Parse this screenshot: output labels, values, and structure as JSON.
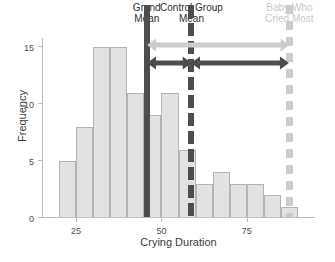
{
  "chart_data": {
    "type": "bar",
    "title": "",
    "subtitle": "",
    "xlabel": "Crying Duration",
    "ylabel": "Frequency",
    "xlim": [
      15,
      95
    ],
    "ylim": [
      0,
      15.8
    ],
    "xticks": [
      25,
      50,
      75
    ],
    "yticks": [
      0,
      5,
      10,
      15
    ],
    "grid": false,
    "legend_position": "none",
    "bin_width": 5,
    "bin_starts": [
      20,
      25,
      30,
      35,
      40,
      45,
      50,
      55,
      60,
      65,
      70,
      75,
      80,
      85
    ],
    "categories": [
      "20-25",
      "25-30",
      "30-35",
      "35-40",
      "40-45",
      "45-50",
      "50-55",
      "55-60",
      "60-65",
      "65-70",
      "70-75",
      "75-80",
      "80-85",
      "85-90"
    ],
    "values": [
      5,
      8,
      15,
      15,
      11,
      9,
      11,
      6,
      3,
      4,
      3,
      3,
      2,
      1
    ],
    "bar_color": "#e2e2e2",
    "bar_edge_color": "#b4b4b4",
    "annotations": [
      {
        "name": "grand-mean",
        "label": "Grand\nMean",
        "label_line1": "Grand",
        "label_line2": "Mean",
        "x": 45.7,
        "style": "solid",
        "color": "#4d4d4d"
      },
      {
        "name": "control-group-mean",
        "label": "Control Group\nMean",
        "label_line1": "Control Group",
        "label_line2": "Mean",
        "x": 58.8,
        "style": "dashed",
        "color": "#4d4d4d"
      },
      {
        "name": "baby-who-cried-most",
        "label": "Baby Who\nCried Most",
        "label_line1": "Baby Who",
        "label_line2": "Cried Most",
        "x": 87.5,
        "style": "dashed",
        "color": "#cccccc"
      }
    ],
    "span_arrows": [
      {
        "name": "total-deviation",
        "from": 45.7,
        "to": 87.5,
        "color": "#cccccc",
        "row": 1
      },
      {
        "name": "between-group-deviation",
        "from": 45.7,
        "to": 58.8,
        "color": "#4d4d4d",
        "row": 2
      },
      {
        "name": "within-group-deviation",
        "from": 58.8,
        "to": 87.5,
        "color": "#4d4d4d",
        "row": 2
      }
    ]
  },
  "axis": {
    "line_color": "#bdbdbd",
    "tick_label_color": "#4d4d4d",
    "axis_label_color": "#3d3d3d"
  }
}
